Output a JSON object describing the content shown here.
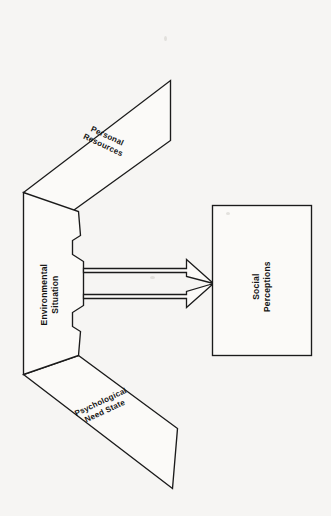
{
  "diagram": {
    "type": "flow-diagram",
    "orientation": "rotated-90-clockwise-scan",
    "background_color": "#f6f5f3",
    "line_color": "#1b1b1b",
    "fill_color": "#fbfaf8",
    "nodes": [
      {
        "id": "personal-resources",
        "label": "Personal\nResources",
        "shape": "parallelogram",
        "position": "upper-left"
      },
      {
        "id": "environmental-situation",
        "label": "Environmental\nSituation",
        "shape": "bracket",
        "position": "left-center"
      },
      {
        "id": "psychological-need-state",
        "label": "Psychological\nNeed State",
        "shape": "parallelogram",
        "position": "lower-left"
      },
      {
        "id": "social-perceptions",
        "label": "Social\nPerceptions",
        "shape": "rectangle",
        "position": "right-center"
      }
    ],
    "arrows": [
      {
        "id": "arrow-upper",
        "from": "environmental-situation",
        "to": "social-perceptions",
        "direction": "right",
        "style": "block-arrow"
      },
      {
        "id": "arrow-lower",
        "from": "environmental-situation",
        "to": "social-perceptions",
        "direction": "right",
        "style": "block-arrow"
      }
    ]
  }
}
